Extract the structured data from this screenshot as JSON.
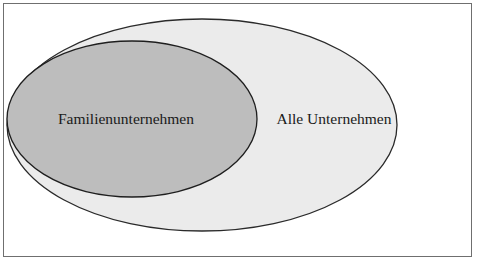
{
  "diagram": {
    "type": "euler-subset",
    "outer_set": {
      "label": "Alle Unternehmen",
      "fill": "#ebebeb",
      "stroke": "#2a2a2a"
    },
    "inner_set": {
      "label": "Familienunternehmen",
      "fill": "#bdbdbd",
      "stroke": "#1e1e1e"
    },
    "frame_color": "#6f6f6f"
  }
}
